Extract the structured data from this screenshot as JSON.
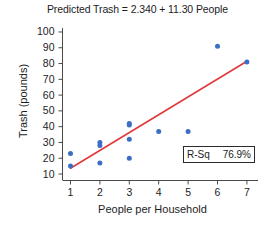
{
  "chart_data": {
    "type": "scatter",
    "title": "Predicted Trash = 2.340 + 11.30 People",
    "xlabel": "People per Household",
    "ylabel": "Trash (pounds)",
    "xlim": [
      0.6,
      7.5
    ],
    "ylim": [
      8,
      104
    ],
    "xticks": [
      1,
      2,
      3,
      4,
      5,
      6,
      7
    ],
    "yticks": [
      10,
      20,
      30,
      40,
      50,
      60,
      70,
      80,
      90,
      100
    ],
    "grid": false,
    "legend_position": "lower-right",
    "series": [
      {
        "name": "observations",
        "type": "scatter",
        "color": "#3b6ec4",
        "marker": "circle",
        "x": [
          1,
          1,
          2,
          2,
          2,
          3,
          3,
          3,
          3,
          4,
          5,
          6,
          7
        ],
        "y": [
          23,
          15,
          30,
          28,
          17,
          42,
          41,
          32,
          20,
          37,
          37,
          91,
          81
        ]
      },
      {
        "name": "fitted-regression-line",
        "type": "line",
        "color": "#e03a3a",
        "equation": "Trash = 2.340 + 11.30 * People",
        "intercept": 2.34,
        "slope": 11.3,
        "x": [
          1,
          7
        ],
        "y": [
          13.64,
          81.44
        ]
      }
    ],
    "annotations": [
      {
        "label": "R-Sq",
        "value": "76.9%"
      }
    ]
  },
  "legend": {
    "rsq_label": "R-Sq",
    "rsq_value": "76.9%"
  },
  "colors": {
    "marker": "#3b6ec4",
    "line": "#e03a3a",
    "axis": "#4a4a4a",
    "text": "#1d1d1d"
  }
}
